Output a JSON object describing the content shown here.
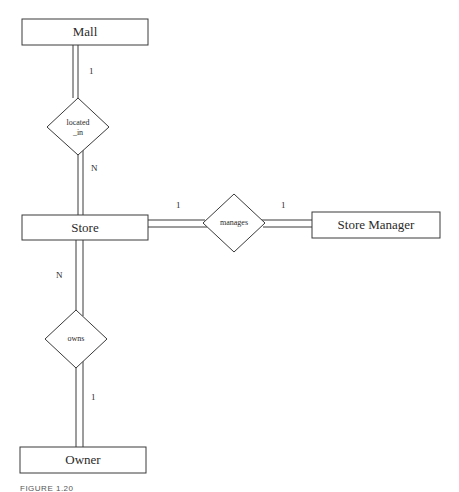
{
  "diagram": {
    "type": "ER diagram",
    "entities": {
      "mall": "Mall",
      "store": "Store",
      "store_manager": "Store Manager",
      "owner": "Owner"
    },
    "relationships": {
      "located_in": {
        "label_line1": "located",
        "label_line2": "_in",
        "card_top": "1",
        "card_bottom": "N"
      },
      "manages": {
        "label": "manages",
        "card_left": "1",
        "card_right": "1"
      },
      "owns": {
        "label": "owns",
        "card_top": "N",
        "card_bottom": "1"
      }
    },
    "caption": "FIGURE 1.20"
  },
  "colors": {
    "stroke": "#3a3a3a",
    "background": "#ffffff"
  }
}
